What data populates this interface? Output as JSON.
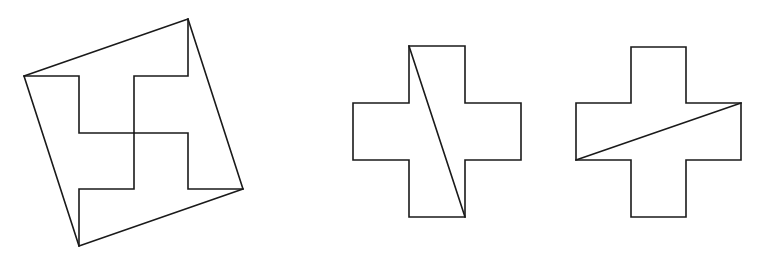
{
  "canvas": {
    "width": 761,
    "height": 262,
    "background": "#ffffff",
    "stroke": "#1a1a1a"
  },
  "figures": [
    {
      "name": "square-with-swastika-dissection",
      "outer_square": [
        [
          188,
          19
        ],
        [
          243,
          189
        ],
        [
          79,
          246
        ],
        [
          24,
          76
        ]
      ],
      "inner_segments": [
        [
          [
            24,
            76
          ],
          [
            79,
            76
          ],
          [
            79,
            133
          ],
          [
            134,
            133
          ]
        ],
        [
          [
            188,
            19
          ],
          [
            188,
            76
          ],
          [
            134,
            76
          ],
          [
            134,
            189
          ],
          [
            79,
            189
          ],
          [
            79,
            246
          ]
        ],
        [
          [
            134,
            133
          ],
          [
            188,
            133
          ],
          [
            188,
            189
          ],
          [
            243,
            189
          ]
        ]
      ]
    },
    {
      "name": "cross-with-steep-diagonal",
      "outline": [
        [
          409,
          46
        ],
        [
          465,
          46
        ],
        [
          465,
          103
        ],
        [
          521,
          103
        ],
        [
          521,
          160
        ],
        [
          465,
          160
        ],
        [
          465,
          217
        ],
        [
          409,
          217
        ],
        [
          409,
          160
        ],
        [
          353,
          160
        ],
        [
          353,
          103
        ],
        [
          409,
          103
        ]
      ],
      "diagonal": [
        [
          409,
          46
        ],
        [
          465,
          217
        ]
      ]
    },
    {
      "name": "cross-with-shallow-diagonal",
      "outline": [
        [
          631,
          47
        ],
        [
          686,
          47
        ],
        [
          686,
          103
        ],
        [
          741,
          103
        ],
        [
          741,
          160
        ],
        [
          686,
          160
        ],
        [
          686,
          217
        ],
        [
          631,
          217
        ],
        [
          631,
          160
        ],
        [
          576,
          160
        ],
        [
          576,
          103
        ],
        [
          631,
          103
        ]
      ],
      "diagonal": [
        [
          576,
          160
        ],
        [
          741,
          103
        ]
      ]
    }
  ]
}
